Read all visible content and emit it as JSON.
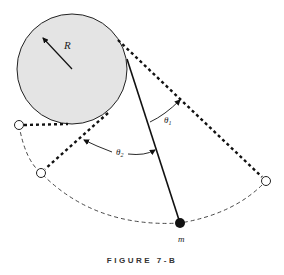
{
  "labels": {
    "radius": "R",
    "theta1": "θ",
    "theta1_sub": "1",
    "theta2": "θ",
    "theta2_sub": "2",
    "mass": "m"
  },
  "caption": "FIGURE 7-B",
  "colors": {
    "drum_fill": "#e4e4e4",
    "line": "#111111"
  }
}
